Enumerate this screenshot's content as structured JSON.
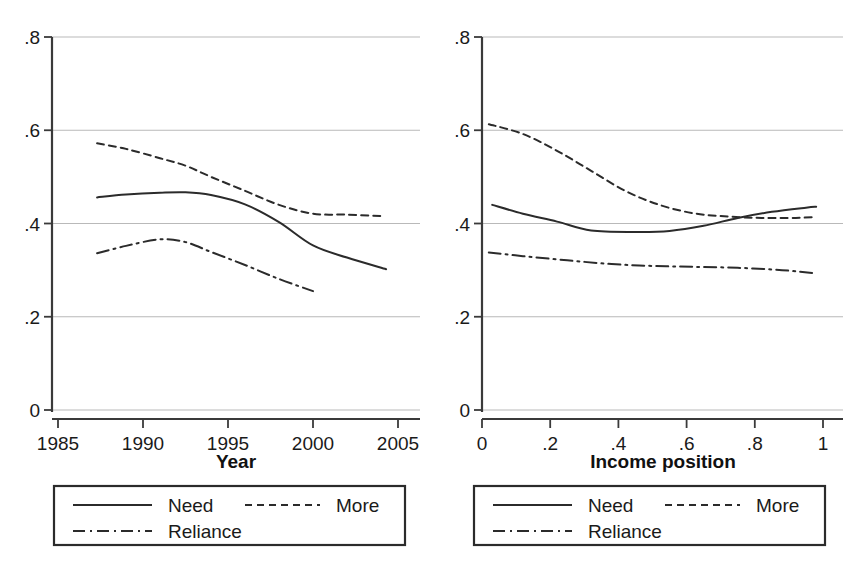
{
  "figure": {
    "background_color": "#ffffff",
    "line_color": "#2b2b2b",
    "grid_color": "#b9b9b9",
    "axis_color": "#3a3a3a"
  },
  "chart_data": [
    {
      "type": "line",
      "panel": "left",
      "title": "",
      "xlabel": "Year",
      "ylabel": "",
      "xlim": [
        1985,
        2005
      ],
      "ylim": [
        0,
        0.8
      ],
      "xticks": [
        1985,
        1990,
        1995,
        2000,
        2005
      ],
      "xticklabels": [
        "1985",
        "1990",
        "1995",
        "2000",
        "2005"
      ],
      "yticks": [
        0,
        0.2,
        0.4,
        0.6,
        0.8
      ],
      "yticklabels": [
        "0",
        ".2",
        ".4",
        ".6",
        ".8"
      ],
      "grid": true,
      "grid_axis": "y",
      "legend_position": "below",
      "series": [
        {
          "name": "Need",
          "style": "solid",
          "x": [
            1987.3,
            1989,
            1991,
            1992.5,
            1994,
            1996,
            1998,
            2000,
            2002,
            2004.3
          ],
          "values": [
            0.456,
            0.462,
            0.466,
            0.467,
            0.461,
            0.441,
            0.403,
            0.353,
            0.327,
            0.302
          ]
        },
        {
          "name": "More",
          "style": "dashed",
          "x": [
            1987.3,
            1989,
            1991,
            1992.5,
            1994,
            1996,
            1998,
            2000,
            2002,
            2004.0
          ],
          "values": [
            0.572,
            0.56,
            0.54,
            0.524,
            0.5,
            0.47,
            0.44,
            0.421,
            0.419,
            0.416
          ]
        },
        {
          "name": "Reliance",
          "style": "dashdot",
          "x": [
            1987.3,
            1989,
            1991,
            1992.5,
            1994,
            1996,
            1998,
            2000
          ],
          "values": [
            0.336,
            0.352,
            0.366,
            0.36,
            0.339,
            0.311,
            0.281,
            0.255
          ]
        }
      ]
    },
    {
      "type": "line",
      "panel": "right",
      "title": "",
      "xlabel": "Income position",
      "ylabel": "",
      "xlim": [
        0,
        1
      ],
      "ylim": [
        0,
        0.8
      ],
      "xticks": [
        0,
        0.2,
        0.4,
        0.6,
        0.8,
        1
      ],
      "xticklabels": [
        "0",
        ".2",
        ".4",
        ".6",
        ".8",
        "1"
      ],
      "yticks": [
        0,
        0.2,
        0.4,
        0.6,
        0.8
      ],
      "yticklabels": [
        "0",
        ".2",
        ".4",
        ".6",
        ".8"
      ],
      "grid": true,
      "grid_axis": "y",
      "legend_position": "below",
      "series": [
        {
          "name": "Need",
          "style": "solid",
          "x": [
            0.03,
            0.12,
            0.22,
            0.32,
            0.45,
            0.55,
            0.65,
            0.75,
            0.85,
            0.95,
            0.98
          ],
          "values": [
            0.44,
            0.421,
            0.404,
            0.385,
            0.382,
            0.384,
            0.395,
            0.412,
            0.425,
            0.434,
            0.436
          ]
        },
        {
          "name": "More",
          "style": "dashed",
          "x": [
            0.02,
            0.12,
            0.22,
            0.32,
            0.42,
            0.52,
            0.62,
            0.72,
            0.82,
            0.92,
            0.98
          ],
          "values": [
            0.613,
            0.592,
            0.556,
            0.513,
            0.47,
            0.44,
            0.422,
            0.415,
            0.412,
            0.412,
            0.414
          ]
        },
        {
          "name": "Reliance",
          "style": "dashdot",
          "x": [
            0.02,
            0.12,
            0.25,
            0.38,
            0.5,
            0.62,
            0.75,
            0.88,
            0.98
          ],
          "values": [
            0.338,
            0.33,
            0.321,
            0.313,
            0.309,
            0.307,
            0.305,
            0.3,
            0.293
          ]
        }
      ]
    }
  ],
  "panels": [
    {
      "id": "left",
      "xlabel": "Year",
      "yticklabels": [
        "0",
        ".2",
        ".4",
        ".6",
        ".8"
      ],
      "xticklabels": [
        "1985",
        "1990",
        "1995",
        "2000",
        "2005"
      ],
      "legend": {
        "entries": [
          {
            "label": "Need",
            "style": "solid"
          },
          {
            "label": "More",
            "style": "dashed"
          },
          {
            "label": "Reliance",
            "style": "dashdot"
          }
        ]
      }
    },
    {
      "id": "right",
      "xlabel": "Income position",
      "yticklabels": [
        "0",
        ".2",
        ".4",
        ".6",
        ".8"
      ],
      "xticklabels": [
        "0",
        ".2",
        ".4",
        ".6",
        ".8",
        "1"
      ],
      "legend": {
        "entries": [
          {
            "label": "Need",
            "style": "solid"
          },
          {
            "label": "More",
            "style": "dashed"
          },
          {
            "label": "Reliance",
            "style": "dashdot"
          }
        ]
      }
    }
  ]
}
